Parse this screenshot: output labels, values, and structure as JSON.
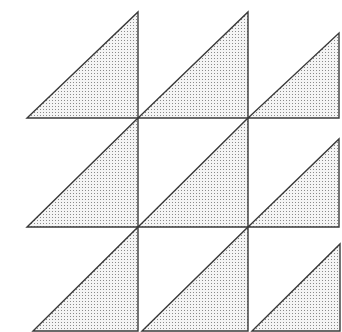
{
  "diagram": {
    "title": "",
    "colors": {
      "background": "#ffffff",
      "stroke": "#3a3a3a",
      "fill": "#f4f4f4",
      "dot": "#8a8a8a"
    },
    "stroke_width": 1.4,
    "triangles": [
      {
        "id": "r1c1",
        "points": [
          [
            27,
            118
          ],
          [
            138,
            118
          ],
          [
            138,
            12
          ]
        ]
      },
      {
        "id": "r1c2",
        "points": [
          [
            138,
            118
          ],
          [
            248,
            118
          ],
          [
            248,
            12
          ]
        ]
      },
      {
        "id": "r1c3",
        "points": [
          [
            248,
            118
          ],
          [
            339,
            118
          ],
          [
            339,
            33
          ]
        ]
      },
      {
        "id": "r2c1",
        "points": [
          [
            27,
            227
          ],
          [
            138,
            227
          ],
          [
            138,
            118
          ]
        ]
      },
      {
        "id": "r2c2",
        "points": [
          [
            138,
            227
          ],
          [
            248,
            227
          ],
          [
            248,
            118
          ]
        ]
      },
      {
        "id": "r2c3",
        "points": [
          [
            248,
            227
          ],
          [
            339,
            227
          ],
          [
            339,
            139
          ]
        ]
      },
      {
        "id": "r3c1",
        "points": [
          [
            33,
            331
          ],
          [
            138,
            331
          ],
          [
            138,
            227
          ]
        ]
      },
      {
        "id": "r3c2",
        "points": [
          [
            142,
            331
          ],
          [
            248,
            331
          ],
          [
            248,
            227
          ]
        ]
      },
      {
        "id": "r3c3",
        "points": [
          [
            252,
            331
          ],
          [
            340,
            331
          ],
          [
            340,
            244
          ]
        ]
      }
    ]
  }
}
